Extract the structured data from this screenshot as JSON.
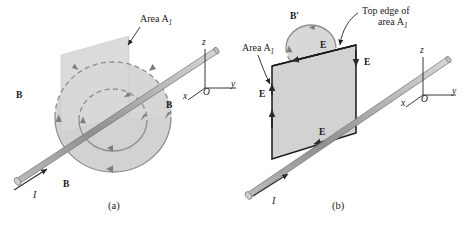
{
  "figure": {
    "background_color": "#ffffff",
    "ink_color": "#1a1a1a",
    "shade_color": "#d2d2d2",
    "plane_color": "#d8d8d8",
    "rod_color": "#a8a8a8",
    "field_line_color": "#8a8a8a"
  },
  "panel_a": {
    "caption": "(a)",
    "area_label": "Area A",
    "area_subscript": "1",
    "current_label": "I",
    "b_labels": [
      "B",
      "B",
      "B"
    ],
    "axes": {
      "z": "z",
      "y": "y",
      "x": "x",
      "origin": "O"
    },
    "description": "Current-carrying rod with circular magnetic field lines and a flat surface of area A-sub-1 pierced by the rod"
  },
  "panel_b": {
    "caption": "(b)",
    "area_label": "Area A",
    "area_subscript": "1",
    "top_edge_label_line1": "Top edge of",
    "top_edge_label_line2": "area A",
    "top_edge_subscript": "1",
    "current_label": "I",
    "b_prime_label": "B′",
    "e_labels": [
      "E",
      "E",
      "E",
      "E"
    ],
    "axes": {
      "z": "z",
      "y": "y",
      "x": "x",
      "origin": "O"
    },
    "description": "Square loop of area A-sub-1 with electric field E around its edges and magnetic field B-prime circulating at the top edge"
  }
}
